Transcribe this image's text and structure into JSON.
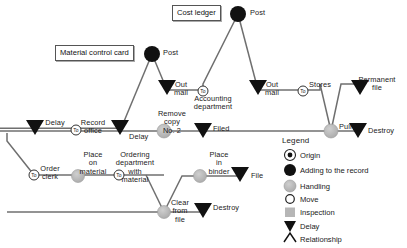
{
  "diagram": {
    "colors": {
      "line": "#6b6b6b",
      "line_dark": "#3a3a3a",
      "origin_fill": "#ffffff",
      "adding_fill": "#111111",
      "handling_fill": "#b3b3b3",
      "move_fill": "#ffffff",
      "inspection_fill": "#b3b3b3",
      "delay_fill": "#111111",
      "text": "#1a1a1a",
      "box_border": "#555555"
    },
    "boxes": [
      {
        "id": "cost-ledger",
        "text": "Cost ledger",
        "x": 172,
        "y": 5,
        "w": 60,
        "h": 14
      },
      {
        "id": "material-control-card",
        "text": "Material control card",
        "x": 55,
        "y": 45,
        "w": 92,
        "h": 14
      }
    ],
    "nodes": [
      {
        "id": "post-cost-ledger",
        "type": "adding",
        "label": "Post",
        "x": 238,
        "y": 14
      },
      {
        "id": "post-material-card",
        "type": "adding",
        "label": "Post",
        "x": 152,
        "y": 54
      },
      {
        "id": "move-accounting",
        "type": "move",
        "label": "To",
        "x": 203,
        "y": 95
      },
      {
        "id": "move-stores",
        "type": "move",
        "label": "To",
        "x": 303,
        "y": 95
      },
      {
        "id": "move-record-office",
        "type": "move",
        "label": "To",
        "x": 76,
        "y": 129
      },
      {
        "id": "move-order-clerk",
        "type": "move",
        "label": "To",
        "x": 34,
        "y": 175
      },
      {
        "id": "move-ordering-dept",
        "type": "move",
        "label": "To",
        "x": 119,
        "y": 175
      },
      {
        "id": "handling-remove-copy",
        "type": "handling",
        "label": "Remove copy No. 2",
        "x": 164,
        "y": 135
      },
      {
        "id": "handling-pull",
        "type": "handling",
        "label": "Pull",
        "x": 331,
        "y": 135
      },
      {
        "id": "handling-place-on-material",
        "type": "handling",
        "label": "Place on material",
        "x": 78,
        "y": 176
      },
      {
        "id": "handling-place-in-binder",
        "type": "handling",
        "label": "Place in binder",
        "x": 200,
        "y": 176
      },
      {
        "id": "handling-clear-from-file",
        "type": "handling",
        "label": "Clear from file",
        "x": 164,
        "y": 212
      },
      {
        "id": "delay-out-mail-1",
        "type": "delay",
        "label": "Out mail",
        "x": 167,
        "y": 90
      },
      {
        "id": "delay-out-mail-2",
        "type": "delay",
        "label": "Out mail",
        "x": 258,
        "y": 90
      },
      {
        "id": "delay-permanent-file",
        "type": "delay",
        "label": "Permanent file",
        "x": 360,
        "y": 90
      },
      {
        "id": "delay-left",
        "type": "delay",
        "label": "Delay",
        "x": 35,
        "y": 128
      },
      {
        "id": "delay-record-office",
        "type": "delay",
        "label": "Delay",
        "x": 120,
        "y": 128
      },
      {
        "id": "delay-filed",
        "type": "delay",
        "label": "Filed",
        "x": 203,
        "y": 135
      },
      {
        "id": "delay-destroy-top",
        "type": "delay",
        "label": "Destroy",
        "x": 358,
        "y": 135
      },
      {
        "id": "delay-file",
        "type": "delay",
        "label": "File",
        "x": 240,
        "y": 176
      },
      {
        "id": "delay-destroy-bottom",
        "type": "delay",
        "label": "Destroy",
        "x": 203,
        "y": 212
      }
    ],
    "flow_labels": [
      {
        "id": "post-1",
        "text": "Post",
        "x": 240,
        "y": 11
      },
      {
        "id": "post-2",
        "text": "Post",
        "x": 155,
        "y": 51
      },
      {
        "id": "out-mail-1",
        "text": "Out\nmail",
        "x": 180,
        "y": 86
      },
      {
        "id": "accounting-department",
        "text": "Accounting\ndepartment",
        "x": 212,
        "y": 96
      },
      {
        "id": "out-mail-2",
        "text": "Out\nmail",
        "x": 271,
        "y": 86
      },
      {
        "id": "stores",
        "text": "Stores",
        "x": 315,
        "y": 86
      },
      {
        "id": "permanent-file",
        "text": "Permanent\nfile",
        "x": 371,
        "y": 80
      },
      {
        "id": "delay-1",
        "text": "Delay",
        "x": 50,
        "y": 122
      },
      {
        "id": "record-office",
        "text": "Record\noffice",
        "x": 84,
        "y": 122
      },
      {
        "id": "delay-2",
        "text": "Delay",
        "x": 126,
        "y": 137
      },
      {
        "id": "remove-copy",
        "text": "Remove\ncopy\nNo. 2",
        "x": 170,
        "y": 113
      },
      {
        "id": "filed",
        "text": "Filed",
        "x": 212,
        "y": 129
      },
      {
        "id": "pull",
        "text": "Pull",
        "x": 340,
        "y": 126
      },
      {
        "id": "destroy-1",
        "text": "Destroy",
        "x": 370,
        "y": 131
      },
      {
        "id": "order-clerk",
        "text": "Order\nclerk",
        "x": 42,
        "y": 168
      },
      {
        "id": "place-on-material",
        "text": "Place\non\nmaterial",
        "x": 88,
        "y": 155
      },
      {
        "id": "ordering-department",
        "text": "Ordering\ndepartment\nwith\nmaterial",
        "x": 128,
        "y": 155
      },
      {
        "id": "place-in-binder",
        "text": "Place\nin\nbinder",
        "x": 212,
        "y": 155
      },
      {
        "id": "file",
        "text": "File",
        "x": 252,
        "y": 172
      },
      {
        "id": "clear-from-file",
        "text": "Clear\nfrom\nfile",
        "x": 172,
        "y": 203
      },
      {
        "id": "destroy-2",
        "text": "Destroy",
        "x": 214,
        "y": 208
      }
    ],
    "legend": {
      "title": "Legend",
      "x": 282,
      "y": 141,
      "items": [
        {
          "id": "origin",
          "symbol": "origin",
          "label": "Origin"
        },
        {
          "id": "adding",
          "symbol": "adding",
          "label": "Adding to the record"
        },
        {
          "id": "handling",
          "symbol": "handling",
          "label": "Handling"
        },
        {
          "id": "move",
          "symbol": "move",
          "label": "Move"
        },
        {
          "id": "inspection",
          "symbol": "inspection",
          "label": "Inspection"
        },
        {
          "id": "delay",
          "symbol": "delay",
          "label": "Delay"
        },
        {
          "id": "relationship",
          "symbol": "relationship",
          "label": "Relationship"
        }
      ]
    }
  }
}
